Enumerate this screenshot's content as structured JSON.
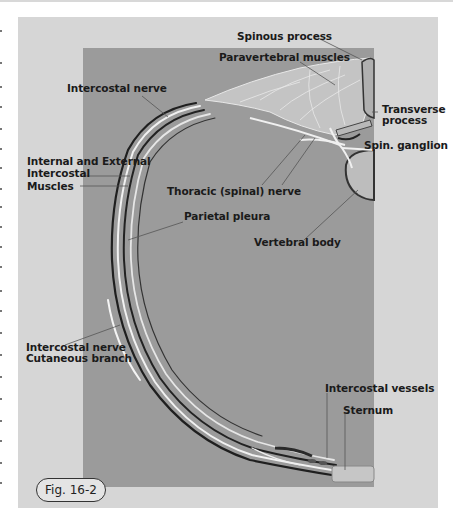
{
  "figure": {
    "label": "Fig. 16-2",
    "colors": {
      "page_bg": "#ffffff",
      "outer_panel": "#d6d6d6",
      "inner_panel": "#9b9b9b",
      "label_text": "#1a1a1a",
      "leader_line": "#555555"
    }
  },
  "labels": {
    "spinous_process": "Spinous process",
    "paravertebral_muscles": "Paravertebral muscles",
    "intercostal_nerve": "Intercostal nerve",
    "transverse_process_1": "Transverse",
    "transverse_process_2": "process",
    "spin_ganglion": "Spin. ganglion",
    "int_ext_1": "Internal and External",
    "int_ext_2": "Intercostal",
    "int_ext_3": "Muscles",
    "thoracic_nerve": "Thoracic (spinal)  nerve",
    "parietal_pleura": "Parietal pleura",
    "vertebral_body": "Vertebral body",
    "cutaneous_1": "Intercostal nerve",
    "cutaneous_2": "Cutaneous branch",
    "intercostal_vessels": "Intercostal vessels",
    "sternum": "Sternum"
  }
}
